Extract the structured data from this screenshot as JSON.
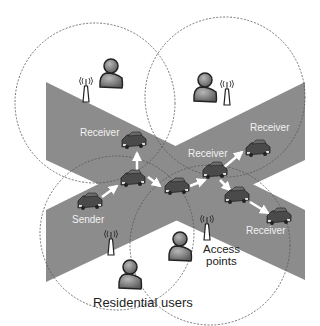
{
  "diagram": {
    "colors": {
      "road": "#8c8c8c",
      "background": "#ffffff",
      "car_body": "#4a4a4a",
      "user_fill": "#7a7a7a",
      "arrow": "#ffffff",
      "circle": "#555555"
    },
    "labels": {
      "receiver_1": "Receiver",
      "receiver_2": "Receiver",
      "receiver_3": "Receiver",
      "receiver_4": "Receiver",
      "sender": "Sender",
      "access_points_line1": "Access",
      "access_points_line2": "points",
      "residential_users": "Residential users"
    },
    "nodes": [
      {
        "id": "sender",
        "type": "car",
        "label": "Sender"
      },
      {
        "id": "relay1",
        "type": "car"
      },
      {
        "id": "receiver_top_left",
        "type": "car",
        "label": "Receiver"
      },
      {
        "id": "relay2",
        "type": "car"
      },
      {
        "id": "receiver_center",
        "type": "car",
        "label": "Receiver"
      },
      {
        "id": "receiver_top_right",
        "type": "car",
        "label": "Receiver"
      },
      {
        "id": "relay3",
        "type": "car"
      },
      {
        "id": "receiver_bottom_right",
        "type": "car",
        "label": "Receiver"
      }
    ],
    "edges": [
      {
        "from": "sender",
        "to": "relay1"
      },
      {
        "from": "relay1",
        "to": "receiver_top_left"
      },
      {
        "from": "relay1",
        "to": "relay2"
      },
      {
        "from": "relay2",
        "to": "receiver_center"
      },
      {
        "from": "receiver_center",
        "to": "receiver_top_right"
      },
      {
        "from": "receiver_center",
        "to": "relay3"
      },
      {
        "from": "relay3",
        "to": "receiver_bottom_right"
      }
    ],
    "icons": {
      "access_point": "antenna-tower-icon",
      "user": "person-icon",
      "car": "car-icon"
    }
  }
}
